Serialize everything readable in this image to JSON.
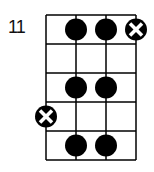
{
  "diagram": {
    "type": "fretboard-scale-diagram",
    "start_fret_label": "11",
    "strings": 4,
    "frets": 5,
    "notes": [
      {
        "fret": 1,
        "string": 2,
        "kind": "dot"
      },
      {
        "fret": 1,
        "string": 3,
        "kind": "dot"
      },
      {
        "fret": 1,
        "string": 4,
        "kind": "x-dot"
      },
      {
        "fret": 3,
        "string": 2,
        "kind": "dot"
      },
      {
        "fret": 3,
        "string": 3,
        "kind": "dot"
      },
      {
        "fret": 4,
        "string": 1,
        "kind": "x-dot"
      },
      {
        "fret": 5,
        "string": 2,
        "kind": "dot"
      },
      {
        "fret": 5,
        "string": 3,
        "kind": "dot"
      }
    ],
    "colors": {
      "line": "#000000",
      "dot": "#000000",
      "x": "#ffffff",
      "background": "#ffffff"
    }
  }
}
